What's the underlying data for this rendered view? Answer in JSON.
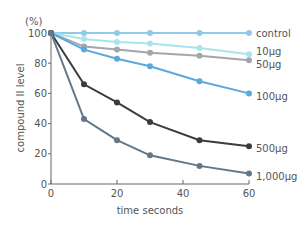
{
  "chart_data": {
    "type": "line",
    "title": "",
    "unit_label": "(%)",
    "xlabel": "time seconds",
    "ylabel": "compound II level",
    "xlim": [
      0,
      60
    ],
    "ylim": [
      0,
      100
    ],
    "xticks": [
      0,
      20,
      40,
      60
    ],
    "yticks": [
      0,
      20,
      40,
      60,
      80,
      100
    ],
    "grid": false,
    "legend_position": "right, inline at line ends",
    "x": [
      0,
      10,
      20,
      30,
      45,
      60
    ],
    "series": [
      {
        "name": "control",
        "color": "#8fcbe8",
        "values": [
          100,
          100,
          100,
          100,
          100,
          100
        ]
      },
      {
        "name": "10µg",
        "color": "#a8e4ee",
        "values": [
          100,
          96,
          94,
          93,
          90,
          86
        ]
      },
      {
        "name": "50µg",
        "color": "#a3a7ab",
        "values": [
          100,
          91,
          89,
          87,
          85,
          82
        ]
      },
      {
        "name": "100µg",
        "color": "#5aa9de",
        "values": [
          100,
          89,
          83,
          78,
          68,
          60
        ]
      },
      {
        "name": "500µg",
        "color": "#3a3d40",
        "values": [
          100,
          66,
          54,
          41,
          29,
          25
        ]
      },
      {
        "name": "1,000µg",
        "color": "#62788a",
        "values": [
          100,
          43,
          29,
          19,
          12,
          7
        ]
      }
    ]
  }
}
